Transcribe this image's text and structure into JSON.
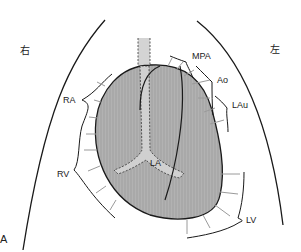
{
  "figure": {
    "panel_label": "A",
    "side_labels": {
      "right": "右",
      "left": "左"
    },
    "structures": [
      {
        "id": "MPA",
        "label": "MPA"
      },
      {
        "id": "Ao",
        "label": "Ao"
      },
      {
        "id": "LAu",
        "label": "LAu"
      },
      {
        "id": "RA",
        "label": "RA"
      },
      {
        "id": "RV",
        "label": "RV"
      },
      {
        "id": "LA",
        "label": "LA"
      },
      {
        "id": "LV",
        "label": "LV"
      }
    ],
    "colors": {
      "heart_fill": "#a8a8a8",
      "trachea_fill": "#d4d4d4",
      "outline": "#1a1a1a",
      "arrow": "#9a9a9a"
    }
  }
}
